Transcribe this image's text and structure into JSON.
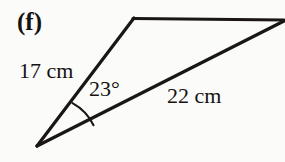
{
  "figure": {
    "part_label": "(f)",
    "stroke_color": "#1a1613",
    "background_color": "#fbfbfa",
    "labels": {
      "left_side": "17 cm",
      "right_side": "22 cm",
      "angle": "23°"
    },
    "geometry": {
      "vertex_bottom_left": [
        37,
        146
      ],
      "vertex_apex": [
        134,
        18
      ],
      "vertex_right": [
        283,
        20
      ],
      "arc_start": [
        72,
        103
      ],
      "arc_end": [
        93,
        125
      ],
      "arc_radius": 50,
      "stroke_width": 3
    },
    "measurements": {
      "left_side_length": "17 cm",
      "right_side_length": "22 cm",
      "included_angle": "23°"
    }
  }
}
